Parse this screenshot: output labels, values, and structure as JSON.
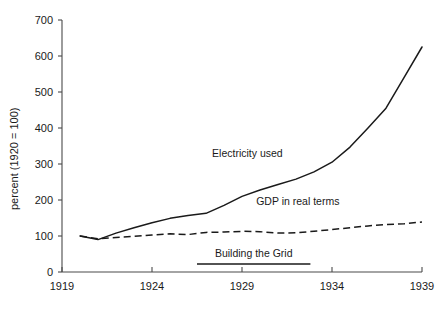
{
  "chart_data": {
    "type": "line",
    "title": "",
    "xlabel": "",
    "ylabel": "percent (1920 = 100)",
    "xlim": [
      1919,
      1939
    ],
    "ylim": [
      0,
      700
    ],
    "grid": false,
    "legend": "inline-labels",
    "x_ticks": [
      "1919",
      "1924",
      "1929",
      "1934",
      "1939"
    ],
    "x_tick_values": [
      1919,
      1924,
      1929,
      1934,
      1939
    ],
    "y_ticks": [
      "0",
      "100",
      "200",
      "300",
      "400",
      "500",
      "600",
      "700"
    ],
    "y_tick_values": [
      0,
      100,
      200,
      300,
      400,
      500,
      600,
      700
    ],
    "x": [
      1920,
      1921,
      1922,
      1923,
      1924,
      1925,
      1926,
      1927,
      1928,
      1929,
      1930,
      1931,
      1932,
      1933,
      1934,
      1935,
      1936,
      1937,
      1938,
      1939
    ],
    "series": [
      {
        "name": "Electricity used",
        "style": "solid",
        "color": "#1a1a1a",
        "values": [
          100,
          90,
          108,
          123,
          137,
          149,
          157,
          163,
          185,
          210,
          228,
          243,
          258,
          278,
          305,
          347,
          400,
          455,
          540,
          625
        ]
      },
      {
        "name": "GDP in real terms",
        "style": "dashed",
        "color": "#1a1a1a",
        "values": [
          100,
          92,
          96,
          99,
          103,
          106,
          104,
          110,
          111,
          113,
          112,
          108,
          109,
          113,
          118,
          123,
          128,
          132,
          134,
          139
        ]
      }
    ],
    "annotations": [
      {
        "name": "Building the Grid",
        "label": "Building the Grid",
        "type": "span-bar",
        "x_start": 1926.5,
        "x_end": 1932.8,
        "y": 22
      }
    ],
    "series_label_positions": [
      {
        "label": "Electricity used",
        "x": 1929.3,
        "y": 320
      },
      {
        "label": "GDP in real terms",
        "x": 1932.1,
        "y": 186
      }
    ]
  }
}
